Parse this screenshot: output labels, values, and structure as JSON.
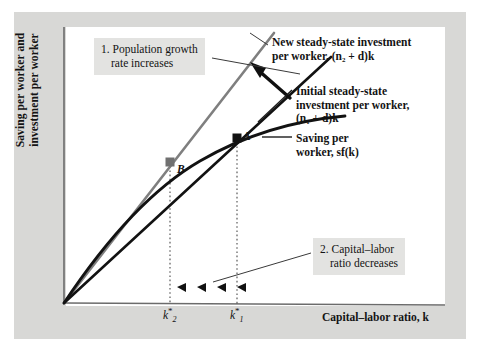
{
  "figure": {
    "type": "economics-diagram",
    "model": "Solow growth model — effect of a population growth rate increase",
    "axes": {
      "y_title_line1": "Saving per worker and",
      "y_title_line2": "investment per worker",
      "x_title": "Capital–labor ratio, k"
    },
    "series": [
      {
        "id": "new-investment",
        "label_line1": "New steady-state investment",
        "label_line2": "per worker, (n₂ + d)k",
        "color": "#7f7f7f",
        "shape": "straight-line-through-origin",
        "slope_note": "steeper line, n2 > n1"
      },
      {
        "id": "initial-investment",
        "label_line1": "Initial steady-state",
        "label_line2": "investment per worker,",
        "label_line3": "(n₁ + d)k",
        "color": "#121212",
        "shape": "straight-line-through-origin",
        "slope_note": "original, flatter line"
      },
      {
        "id": "saving",
        "label_line1": "Saving per",
        "label_line2": "worker, sf(k)",
        "color": "#121212",
        "shape": "concave-increasing-curve"
      }
    ],
    "points": [
      {
        "id": "point-a",
        "letter": "A",
        "color": "#121212",
        "description": "Initial steady state: saving curve meets (n₁ + d)k at k*₁"
      },
      {
        "id": "point-b",
        "letter": "B",
        "color": "#7f7f7f",
        "description": "New steady state: saving curve meets (n₂ + d)k at k*₂"
      }
    ],
    "ticks": [
      {
        "id": "k2",
        "base": "k",
        "sub": "2",
        "sup": "*"
      },
      {
        "id": "k1",
        "base": "k",
        "sub": "1",
        "sup": "*"
      }
    ],
    "annotations": [
      {
        "id": "callout-1",
        "line1": "1. Population growth",
        "line2": "rate increases",
        "points_to": "new-investment-line"
      },
      {
        "id": "callout-2",
        "line1": "2. Capital–labor",
        "line2": "ratio decreases",
        "points_to": "arrow-row-on-x-axis"
      }
    ],
    "motion_arrows": {
      "direction": "left",
      "count": 4,
      "meaning": "capital–labor ratio moves from k*₁ down to k*₂"
    },
    "colors": {
      "mat_background": "#d8d8d6",
      "canvas": "#ffffff",
      "callout_background": "#e3e3e1",
      "ink": "#121212",
      "gray_line": "#7f7f7f",
      "axis": "#6b6b6b"
    }
  }
}
